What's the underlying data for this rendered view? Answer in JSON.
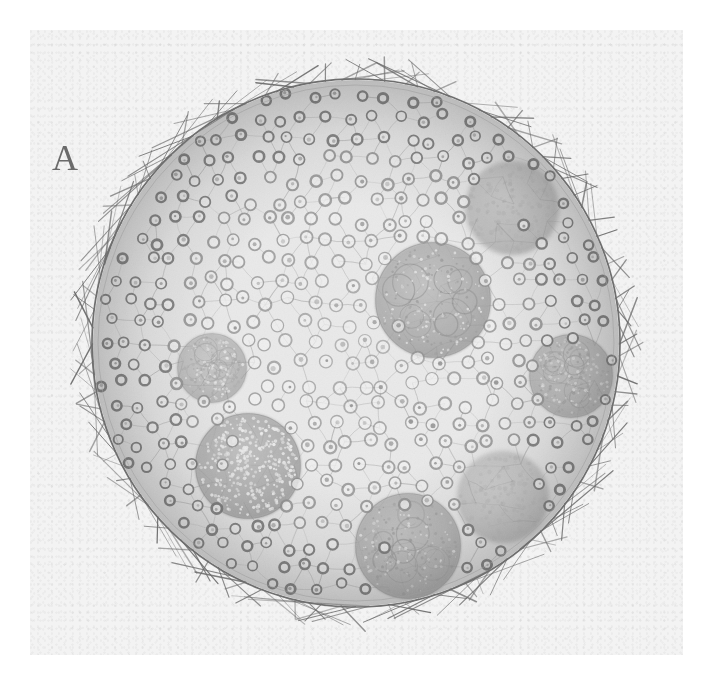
{
  "figure": {
    "panel_label": "A",
    "caption_visible": false
  },
  "canvas": {
    "width": 719,
    "height": 686,
    "background_color": "#ffffff",
    "paper_color": "#f3f3f3",
    "paper_rect": {
      "x": 30,
      "y": 30,
      "width": 653,
      "height": 625
    }
  },
  "colors": {
    "ink": "#6e6e6e",
    "ink_dark": "#575757",
    "ink_light": "#9a9a9a",
    "cell_fill": "#ededed",
    "gonidium_fill": "#a9a9a9",
    "shade": "#b9b9b9",
    "paper": "#f3f3f3"
  },
  "sphere": {
    "name": "colony-sphere",
    "center_x": 356,
    "center_y": 343,
    "radius": 265,
    "membrane_stroke": "#6e6e6e",
    "membrane_width": 1.6,
    "flagella_count": 104,
    "flagella_length": 20,
    "interior_fill": "#e9e9e9"
  },
  "somatic_cells": {
    "name": "somatic-cell-layer",
    "approx_count": 420,
    "cell_radius": 6.2,
    "ring_stroke": "#8e8e8e",
    "description": "ring-shaped somatic cells linked by hexagonal cytoplasmic strands"
  },
  "daughter_colonies": [
    {
      "id": "gonidium-1",
      "label": "upper-right-diffuse",
      "cx": 512,
      "cy": 208,
      "r": 47,
      "tone": "#a6a6a6",
      "texture": "diffuse",
      "opacity": 0.55
    },
    {
      "id": "gonidium-2",
      "label": "center-right-large",
      "cx": 433,
      "cy": 300,
      "r": 58,
      "tone": "#9c9c9c",
      "texture": "lobed",
      "opacity": 0.72
    },
    {
      "id": "gonidium-3",
      "label": "right-edge",
      "cx": 571,
      "cy": 376,
      "r": 42,
      "tone": "#a0a0a0",
      "texture": "lobed",
      "opacity": 0.66
    },
    {
      "id": "gonidium-4",
      "label": "left-small",
      "cx": 212,
      "cy": 368,
      "r": 35,
      "tone": "#a8a8a8",
      "texture": "lobed",
      "opacity": 0.58
    },
    {
      "id": "gonidium-5",
      "label": "lower-left-stippled",
      "cx": 248,
      "cy": 466,
      "r": 53,
      "tone": "#9a9a9a",
      "texture": "stippled",
      "opacity": 0.74
    },
    {
      "id": "gonidium-6",
      "label": "lower-right-faint",
      "cx": 503,
      "cy": 497,
      "r": 46,
      "tone": "#ababab",
      "texture": "diffuse",
      "opacity": 0.5
    },
    {
      "id": "gonidium-7",
      "label": "bottom-center",
      "cx": 408,
      "cy": 546,
      "r": 53,
      "tone": "#9a9a9a",
      "texture": "lobed",
      "opacity": 0.7
    }
  ],
  "shading": {
    "name": "peripheral-shading",
    "type": "radial",
    "inner_stop": 0.55,
    "outer_stop": 1.0,
    "inner_color": "rgba(120,120,120,0)",
    "outer_color": "rgba(110,110,110,0.34)"
  }
}
